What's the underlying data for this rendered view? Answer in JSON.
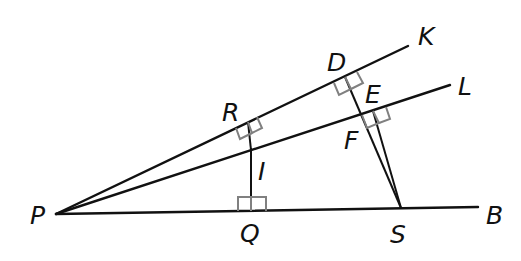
{
  "diagram": {
    "type": "geometry",
    "colors": {
      "line": "#111111",
      "right_angle_marker": "#808080",
      "background": "#ffffff"
    },
    "points": {
      "P": {
        "label": "P",
        "x": 56,
        "y": 214
      },
      "B": {
        "label": "B",
        "x": 478,
        "y": 207
      },
      "K": {
        "label": "K",
        "x": 408,
        "y": 46
      },
      "L": {
        "label": "L",
        "x": 450,
        "y": 85
      },
      "R": {
        "label": "R",
        "x": 248,
        "y": 122
      },
      "I": {
        "label": "I",
        "x": 250,
        "y": 150
      },
      "Q": {
        "label": "Q",
        "x": 251,
        "y": 211
      },
      "D": {
        "label": "D",
        "x": 345,
        "y": 77
      },
      "E": {
        "label": "E",
        "x": 373,
        "y": 111
      },
      "F": {
        "label": "F",
        "x": 362,
        "y": 115
      },
      "S": {
        "label": "S",
        "x": 401,
        "y": 208
      }
    },
    "rays": [
      "PK",
      "PL",
      "PB"
    ],
    "segments": [
      "RI",
      "IQ",
      "DS",
      "ES"
    ],
    "right_angles": [
      "PRI",
      "PQI",
      "PDS",
      "PES"
    ],
    "labels": {
      "P": "P",
      "B": "B",
      "K": "K",
      "L": "L",
      "R": "R",
      "I": "I",
      "Q": "Q",
      "D": "D",
      "E": "E",
      "F": "F",
      "S": "S"
    }
  }
}
